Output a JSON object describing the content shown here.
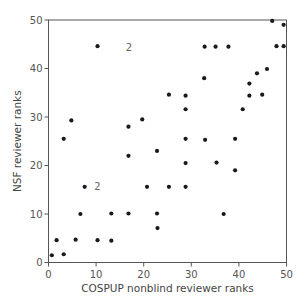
{
  "chart_data": {
    "type": "scatter",
    "title": "",
    "xlabel": "COSPUP nonblind reviewer ranks",
    "ylabel": "NSF reviewer ranks",
    "xlim": [
      0,
      50
    ],
    "ylim": [
      0,
      50
    ],
    "xticks": [
      0,
      10,
      20,
      30,
      40,
      50
    ],
    "yticks": [
      0,
      10,
      20,
      30,
      40,
      50
    ],
    "grid": false,
    "legend": null,
    "marker_color": "#1a1a1a",
    "axis_color": "#555555",
    "points": [
      {
        "x": 0.7,
        "y": 1.5
      },
      {
        "x": 3.2,
        "y": 1.7
      },
      {
        "x": 1.7,
        "y": 4.6
      },
      {
        "x": 5.7,
        "y": 4.7
      },
      {
        "x": 10.3,
        "y": 4.6
      },
      {
        "x": 13.2,
        "y": 4.5
      },
      {
        "x": 6.7,
        "y": 10.0
      },
      {
        "x": 13.2,
        "y": 10.1
      },
      {
        "x": 16.8,
        "y": 10.1
      },
      {
        "x": 22.8,
        "y": 10.1
      },
      {
        "x": 22.9,
        "y": 7.1
      },
      {
        "x": 7.6,
        "y": 15.6
      },
      {
        "x": 16.8,
        "y": 22.0
      },
      {
        "x": 22.8,
        "y": 23.0
      },
      {
        "x": 28.8,
        "y": 20.5
      },
      {
        "x": 20.7,
        "y": 15.6
      },
      {
        "x": 25.3,
        "y": 15.6
      },
      {
        "x": 28.8,
        "y": 15.6
      },
      {
        "x": 4.8,
        "y": 29.3
      },
      {
        "x": 3.2,
        "y": 25.5
      },
      {
        "x": 16.8,
        "y": 28.0
      },
      {
        "x": 19.7,
        "y": 29.5
      },
      {
        "x": 10.3,
        "y": 44.6
      },
      {
        "x": 25.3,
        "y": 34.6
      },
      {
        "x": 28.8,
        "y": 34.4
      },
      {
        "x": 28.8,
        "y": 31.6
      },
      {
        "x": 28.8,
        "y": 25.5
      },
      {
        "x": 32.9,
        "y": 25.3
      },
      {
        "x": 39.2,
        "y": 25.5
      },
      {
        "x": 35.3,
        "y": 20.6
      },
      {
        "x": 39.2,
        "y": 19.0
      },
      {
        "x": 36.8,
        "y": 10.0
      },
      {
        "x": 40.8,
        "y": 31.6
      },
      {
        "x": 32.8,
        "y": 44.5
      },
      {
        "x": 35.1,
        "y": 44.5
      },
      {
        "x": 37.8,
        "y": 44.5
      },
      {
        "x": 47.9,
        "y": 44.6
      },
      {
        "x": 49.4,
        "y": 44.6
      },
      {
        "x": 47.0,
        "y": 49.8
      },
      {
        "x": 49.4,
        "y": 49.0
      },
      {
        "x": 45.9,
        "y": 39.9
      },
      {
        "x": 43.8,
        "y": 39.0
      },
      {
        "x": 32.7,
        "y": 38.0
      },
      {
        "x": 42.2,
        "y": 36.9
      },
      {
        "x": 42.2,
        "y": 34.4
      },
      {
        "x": 44.9,
        "y": 34.6
      }
    ],
    "annotations": [
      {
        "text": "2",
        "x": 16.9,
        "y": 44.4,
        "meaning": "two coincident points"
      },
      {
        "text": "2",
        "x": 10.3,
        "y": 15.6,
        "meaning": "two coincident points"
      }
    ]
  }
}
